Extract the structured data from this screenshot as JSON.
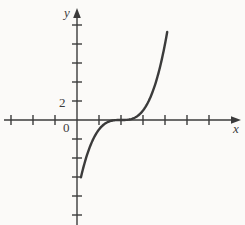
{
  "figure": {
    "name": "cubic-function-graph",
    "background_color": "#fbfaf8",
    "ink_color": "#3b3b3b"
  },
  "axes": {
    "x_axis_label": "x",
    "y_axis_label": "y",
    "origin_label": "0",
    "y_tick_label_2": "2",
    "x_axis_pixel_y": 120,
    "y_axis_pixel_x": 77,
    "x_tick_spacing_px": 22,
    "y_tick_spacing_px": 19,
    "x_tick_positions_px": [
      11,
      33,
      55,
      99,
      121,
      143,
      165,
      187,
      209
    ],
    "y_tick_positions_px": [
      25,
      44,
      63,
      82,
      101,
      139,
      158,
      177,
      196,
      215
    ],
    "x_arrow_end_px": 240,
    "y_arrow_end_px": 8
  },
  "chart_data": {
    "type": "line",
    "title": "",
    "xlabel": "x",
    "ylabel": "y",
    "grid": false,
    "legend": "none",
    "xlim": [
      -3,
      7.4
    ],
    "ylim": [
      -11,
      11
    ],
    "series": [
      {
        "name": "cubic",
        "equation": "y = (x - 2)^3",
        "x": [
          0.2,
          0.4,
          0.6,
          0.8,
          1.0,
          1.2,
          1.4,
          1.6,
          1.8,
          2.0,
          2.2,
          2.4,
          2.6,
          2.8,
          3.0,
          3.2,
          3.4,
          3.6,
          3.8,
          4.0,
          4.2
        ],
        "y": [
          -5.83,
          -4.1,
          -2.74,
          -1.73,
          -1.0,
          -0.51,
          -0.22,
          -0.06,
          -0.01,
          0.0,
          0.01,
          0.06,
          0.22,
          0.51,
          1.0,
          1.73,
          2.74,
          4.1,
          5.83,
          8.0,
          10.65
        ]
      }
    ],
    "annotations": [
      {
        "text": "2",
        "axis": "y",
        "value": 2
      },
      {
        "text": "0",
        "axis": "origin",
        "value": 0
      }
    ],
    "inflection_point": [
      2,
      0
    ]
  }
}
